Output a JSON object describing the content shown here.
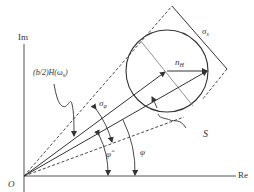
{
  "axes": {
    "im_label": "Im",
    "re_label": "Re",
    "origin_label": "O"
  },
  "labels": {
    "h_label": "(b/2)H(ω",
    "h_sub": "s",
    "h_close": ")",
    "sigma_s": "σ",
    "sigma_s_sub": "s",
    "sigma_phi": "σ",
    "sigma_phi_sub": "φ",
    "n_h": "n",
    "n_h_sub": "H",
    "s_label": "S",
    "phi_hat": "φ̂",
    "phi": "φ"
  },
  "colors": {
    "line": "#333333",
    "thin_line": "#777777",
    "background": "#ffffff"
  }
}
